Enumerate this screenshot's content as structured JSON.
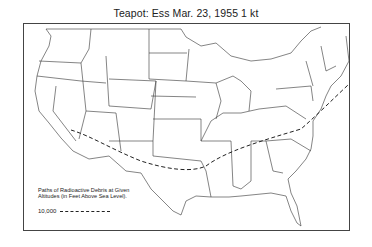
{
  "title": "Teapot: Ess  Mar. 23, 1955  1 kt",
  "legend": {
    "caption": "Paths of Radioactive Debris at Given Altitudes (in Feet Above Sea Level).",
    "entries": [
      {
        "altitude": "10,000",
        "style": "dashed"
      }
    ]
  },
  "map": {
    "region": "Continental United States with state boundaries",
    "path_color": "#222222",
    "line_color": "#333333"
  }
}
